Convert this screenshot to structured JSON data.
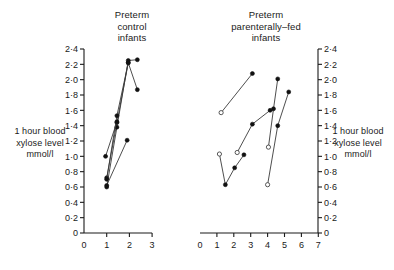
{
  "figure": {
    "background": "#ffffff",
    "marker_filled_color": "#111111",
    "marker_open_color": "#ffffff",
    "line_color": "#3a3a3a",
    "axis_color": "#1a1a1a"
  },
  "panels": {
    "left": {
      "title": "Preterm\ncontrol\ninfants",
      "ylabel": "1 hour blood\nxylose level\nmmol/l"
    },
    "right": {
      "title": "Preterm\nparenterally–fed\ninfants",
      "ylabel": "1 hour blood\nxylose level\nmmol/l"
    }
  },
  "chart_data": [
    {
      "type": "line",
      "title": "Preterm control infants",
      "xlabel": "",
      "ylabel": "1 hour blood xylose level mmol/l",
      "xlim": [
        0,
        3
      ],
      "ylim": [
        0,
        2.4
      ],
      "xticks": [
        "0",
        "1",
        "2",
        "3"
      ],
      "xtick_values": [
        0,
        1,
        2,
        3
      ],
      "yticks": [
        "0",
        "0·2",
        "0·4",
        "0·6",
        "0·8",
        "1·0",
        "1·2",
        "1·4",
        "1·6",
        "1·8",
        "2·0",
        "2·2",
        "2·4"
      ],
      "ytick_values": [
        0,
        0.2,
        0.4,
        0.6,
        0.8,
        1.0,
        1.2,
        1.4,
        1.6,
        1.8,
        2.0,
        2.2,
        2.4
      ],
      "grid": false,
      "legend": "none",
      "y_axis_position": "left",
      "series": [
        {
          "name": "infant-1",
          "marker": "filled",
          "x": [
            1.0,
            1.45,
            1.95,
            2.35
          ],
          "y": [
            0.72,
            1.44,
            2.22,
            1.87
          ]
        },
        {
          "name": "infant-2",
          "marker": "filled",
          "x": [
            1.0,
            1.45,
            1.95,
            2.35
          ],
          "y": [
            0.6,
            1.38,
            2.25,
            2.26
          ]
        },
        {
          "name": "infant-3",
          "marker": "filled",
          "x": [
            1.0,
            1.45,
            1.95
          ],
          "y": [
            0.7,
            1.53,
            2.22
          ]
        },
        {
          "name": "infant-4",
          "marker": "filled",
          "x": [
            0.95,
            1.45
          ],
          "y": [
            1.0,
            1.45
          ]
        },
        {
          "name": "infant-5",
          "marker": "filled",
          "x": [
            1.0,
            1.9
          ],
          "y": [
            0.62,
            1.21
          ]
        }
      ]
    },
    {
      "type": "line",
      "title": "Preterm parenterally–fed infants",
      "xlabel": "",
      "ylabel": "1 hour blood xylose level mmol/l",
      "xlim": [
        0,
        7
      ],
      "ylim": [
        0,
        2.4
      ],
      "xticks": [
        "0",
        "1",
        "2",
        "3",
        "4",
        "5",
        "6",
        "7"
      ],
      "xtick_values": [
        0,
        1,
        2,
        3,
        4,
        5,
        6,
        7
      ],
      "yticks": [
        "0",
        "0·2",
        "0·4",
        "0·6",
        "0·8",
        "1·0",
        "1·2",
        "1·4",
        "1·6",
        "1·8",
        "2·0",
        "2·2",
        "2·4"
      ],
      "ytick_values": [
        0,
        0.2,
        0.4,
        0.6,
        0.8,
        1.0,
        1.2,
        1.4,
        1.6,
        1.8,
        2.0,
        2.2,
        2.4
      ],
      "grid": false,
      "legend": "none",
      "y_axis_position": "right",
      "series": [
        {
          "name": "infant-1",
          "marker_start": "open",
          "marker_end": "filled",
          "x": [
            1.25,
            3.1
          ],
          "y": [
            1.57,
            2.08
          ]
        },
        {
          "name": "infant-2",
          "marker_start": "open",
          "marker_end": "filled",
          "x": [
            4.05,
            4.35,
            4.6
          ],
          "y": [
            1.12,
            1.62,
            2.01
          ]
        },
        {
          "name": "infant-3",
          "marker_start": "open",
          "marker_end": "filled",
          "x": [
            4.0,
            4.6,
            5.25
          ],
          "y": [
            0.63,
            1.4,
            1.84
          ]
        },
        {
          "name": "infant-4",
          "marker_start": "open",
          "marker_end": "filled",
          "x": [
            2.2,
            3.1,
            4.15
          ],
          "y": [
            1.05,
            1.42,
            1.6
          ]
        },
        {
          "name": "infant-5",
          "marker_start": "open",
          "marker_end": "filled",
          "x": [
            1.15,
            1.5,
            2.05,
            2.6
          ],
          "y": [
            1.03,
            0.63,
            0.85,
            1.02
          ]
        }
      ]
    }
  ]
}
